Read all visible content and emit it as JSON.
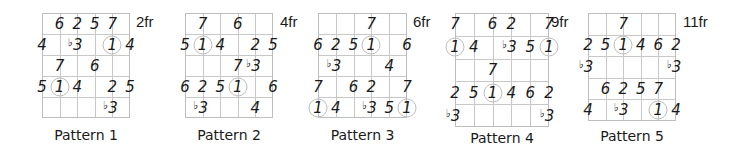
{
  "diagram": {
    "strings": 6,
    "frets": 5,
    "patterns": [
      {
        "title": "Pattern 1",
        "fret_label": "2fr",
        "notes": [
          {
            "s": 1,
            "f": 0,
            "t": "6"
          },
          {
            "s": 2,
            "f": 0,
            "t": "2"
          },
          {
            "s": 3,
            "f": 0,
            "t": "5"
          },
          {
            "s": 4,
            "f": 0,
            "t": "7"
          },
          {
            "s": 0,
            "f": 1,
            "t": "4"
          },
          {
            "s": 2,
            "f": 1,
            "t": "3",
            "flat": true
          },
          {
            "s": 4,
            "f": 1,
            "t": "1",
            "root": true
          },
          {
            "s": 5,
            "f": 1,
            "t": "4"
          },
          {
            "s": 1,
            "f": 2,
            "t": "7"
          },
          {
            "s": 3,
            "f": 2,
            "t": "6"
          },
          {
            "s": 0,
            "f": 3,
            "t": "5"
          },
          {
            "s": 1,
            "f": 3,
            "t": "1",
            "root": true
          },
          {
            "s": 2,
            "f": 3,
            "t": "4"
          },
          {
            "s": 4,
            "f": 3,
            "t": "2"
          },
          {
            "s": 5,
            "f": 3,
            "t": "5"
          },
          {
            "s": 4,
            "f": 4,
            "t": "3",
            "flat": true
          }
        ]
      },
      {
        "title": "Pattern 2",
        "fret_label": "4fr",
        "notes": [
          {
            "s": 1,
            "f": 0,
            "t": "7"
          },
          {
            "s": 3,
            "f": 0,
            "t": "6"
          },
          {
            "s": 0,
            "f": 1,
            "t": "5"
          },
          {
            "s": 1,
            "f": 1,
            "t": "1",
            "root": true
          },
          {
            "s": 2,
            "f": 1,
            "t": "4"
          },
          {
            "s": 4,
            "f": 1,
            "t": "2"
          },
          {
            "s": 5,
            "f": 1,
            "t": "5"
          },
          {
            "s": 3,
            "f": 2,
            "t": "7"
          },
          {
            "s": 4,
            "f": 2,
            "t": "3",
            "flat": true
          },
          {
            "s": 0,
            "f": 3,
            "t": "6"
          },
          {
            "s": 1,
            "f": 3,
            "t": "2"
          },
          {
            "s": 2,
            "f": 3,
            "t": "5"
          },
          {
            "s": 3,
            "f": 3,
            "t": "1",
            "root": true
          },
          {
            "s": 5,
            "f": 3,
            "t": "6"
          },
          {
            "s": 1,
            "f": 4,
            "t": "3",
            "flat": true
          },
          {
            "s": 4,
            "f": 4,
            "t": "4"
          }
        ]
      },
      {
        "title": "Pattern 3",
        "fret_label": "6fr",
        "notes": [
          {
            "s": 3,
            "f": 0,
            "t": "7"
          },
          {
            "s": 0,
            "f": 1,
            "t": "6"
          },
          {
            "s": 1,
            "f": 1,
            "t": "2"
          },
          {
            "s": 2,
            "f": 1,
            "t": "5"
          },
          {
            "s": 3,
            "f": 1,
            "t": "1",
            "root": true
          },
          {
            "s": 5,
            "f": 1,
            "t": "6"
          },
          {
            "s": 1,
            "f": 2,
            "t": "3",
            "flat": true
          },
          {
            "s": 4,
            "f": 2,
            "t": "4"
          },
          {
            "s": 0,
            "f": 3,
            "t": "7"
          },
          {
            "s": 2,
            "f": 3,
            "t": "6"
          },
          {
            "s": 3,
            "f": 3,
            "t": "2"
          },
          {
            "s": 5,
            "f": 3,
            "t": "7"
          },
          {
            "s": 0,
            "f": 4,
            "t": "1",
            "root": true
          },
          {
            "s": 1,
            "f": 4,
            "t": "4"
          },
          {
            "s": 3,
            "f": 4,
            "t": "3",
            "flat": true
          },
          {
            "s": 4,
            "f": 4,
            "t": "5"
          },
          {
            "s": 5,
            "f": 4,
            "t": "1",
            "root": true
          }
        ]
      },
      {
        "title": "Pattern 4",
        "fret_label": "9fr",
        "notes": [
          {
            "s": 0,
            "f": 0,
            "t": "7"
          },
          {
            "s": 2,
            "f": 0,
            "t": "6"
          },
          {
            "s": 3,
            "f": 0,
            "t": "2"
          },
          {
            "s": 5,
            "f": 0,
            "t": "7"
          },
          {
            "s": 0,
            "f": 1,
            "t": "1",
            "root": true
          },
          {
            "s": 1,
            "f": 1,
            "t": "4"
          },
          {
            "s": 3,
            "f": 1,
            "t": "3",
            "flat": true
          },
          {
            "s": 4,
            "f": 1,
            "t": "5"
          },
          {
            "s": 5,
            "f": 1,
            "t": "1",
            "root": true
          },
          {
            "s": 2,
            "f": 2,
            "t": "7"
          },
          {
            "s": 0,
            "f": 3,
            "t": "2"
          },
          {
            "s": 1,
            "f": 3,
            "t": "5"
          },
          {
            "s": 2,
            "f": 3,
            "t": "1",
            "root": true
          },
          {
            "s": 3,
            "f": 3,
            "t": "4"
          },
          {
            "s": 4,
            "f": 3,
            "t": "6"
          },
          {
            "s": 5,
            "f": 3,
            "t": "2"
          },
          {
            "s": 0,
            "f": 4,
            "t": "3",
            "flat": true
          },
          {
            "s": 5,
            "f": 4,
            "t": "3",
            "flat": true
          }
        ]
      },
      {
        "title": "Pattern 5",
        "fret_label": "11fr",
        "notes": [
          {
            "s": 2,
            "f": 0,
            "t": "7"
          },
          {
            "s": 0,
            "f": 1,
            "t": "2"
          },
          {
            "s": 1,
            "f": 1,
            "t": "5"
          },
          {
            "s": 2,
            "f": 1,
            "t": "1",
            "root": true
          },
          {
            "s": 3,
            "f": 1,
            "t": "4"
          },
          {
            "s": 4,
            "f": 1,
            "t": "6"
          },
          {
            "s": 5,
            "f": 1,
            "t": "2"
          },
          {
            "s": 0,
            "f": 2,
            "t": "3",
            "flat": true
          },
          {
            "s": 5,
            "f": 2,
            "t": "3",
            "flat": true
          },
          {
            "s": 1,
            "f": 3,
            "t": "6"
          },
          {
            "s": 2,
            "f": 3,
            "t": "2"
          },
          {
            "s": 3,
            "f": 3,
            "t": "5"
          },
          {
            "s": 4,
            "f": 3,
            "t": "7"
          },
          {
            "s": 0,
            "f": 4,
            "t": "4"
          },
          {
            "s": 2,
            "f": 4,
            "t": "3",
            "flat": true
          },
          {
            "s": 4,
            "f": 4,
            "t": "1",
            "root": true
          },
          {
            "s": 5,
            "f": 4,
            "t": "4"
          }
        ]
      }
    ]
  }
}
